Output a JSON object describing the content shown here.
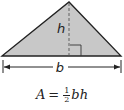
{
  "diagram": {
    "shape": "triangle",
    "fill_color": "#c8c8c8",
    "stroke_color": "#222222",
    "height_label": "h",
    "base_label": "b",
    "right_angle_marker": true
  },
  "formula": {
    "lhs": "A",
    "equals": "=",
    "fraction_numerator": "1",
    "fraction_denominator": "2",
    "rhs_vars": "bh"
  }
}
